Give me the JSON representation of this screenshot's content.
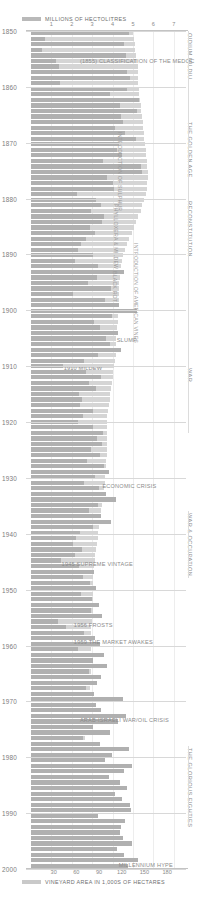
{
  "legend": {
    "top": {
      "swatch": "production-swatch",
      "label": "MILLIONS OF HECTOLITRES"
    },
    "bottom": {
      "swatch": "area-swatch",
      "label": "VINEYARD AREA IN 1,000S OF HECTARES"
    }
  },
  "colors": {
    "production_bar": "#b0b0b0",
    "area_bar": "#d5d5d5",
    "grid": "#ededed",
    "year_line": "#d8d8d8",
    "text": "#8b8b8b"
  },
  "chart_data": {
    "type": "bar",
    "title": "MILLIONS OF HECTOLITRES",
    "xlabel": "MILLIONS OF HECTOLITRES",
    "xlabel_secondary": "VINEYARD AREA IN 1,000S OF HECTARES",
    "ylabel": "",
    "orientation": "horizontal",
    "grid": true,
    "legend_position": "top-left",
    "axis_top": {
      "label": "MILLIONS OF HECTOLITRES",
      "ticks": [
        1,
        2,
        3,
        4,
        5,
        6,
        7
      ],
      "range": [
        0,
        7.6
      ]
    },
    "axis_bottom": {
      "label": "VINEYARD AREA IN 1,000S OF HECTARES",
      "ticks": [
        30,
        60,
        90,
        120,
        150,
        180
      ],
      "range": [
        0,
        205
      ]
    },
    "year_axis": {
      "ticks": [
        1850,
        1860,
        1870,
        1880,
        1890,
        1900,
        1910,
        1920,
        1930,
        1940,
        1950,
        1960,
        1970,
        1980,
        1990,
        2000
      ],
      "range": [
        1850,
        2000
      ]
    },
    "series": [
      {
        "name": "VINEYARD AREA IN 1,000S OF HECTARES",
        "color": "#d5d5d5"
      },
      {
        "name": "MILLIONS OF HECTOLITRES",
        "color": "#b0b0b0"
      }
    ],
    "rows": [
      {
        "year": 1850,
        "production": 4.8,
        "area": 135
      },
      {
        "year": 1851,
        "production": 0.7,
        "area": 136
      },
      {
        "year": 1852,
        "production": 4.55,
        "area": 137
      },
      {
        "year": 1853,
        "production": 0.55,
        "area": 138
      },
      {
        "year": 1854,
        "production": 4.65,
        "area": 139
      },
      {
        "year": 1855,
        "production": 1.25,
        "area": 140
      },
      {
        "year": 1856,
        "production": 1.35,
        "area": 141
      },
      {
        "year": 1857,
        "production": 4.7,
        "area": 141
      },
      {
        "year": 1858,
        "production": 4.85,
        "area": 142
      },
      {
        "year": 1859,
        "production": 1.4,
        "area": 142
      },
      {
        "year": 1860,
        "production": 4.7,
        "area": 143
      },
      {
        "year": 1861,
        "production": 3.85,
        "area": 143
      },
      {
        "year": 1862,
        "production": 5.3,
        "area": 144
      },
      {
        "year": 1863,
        "production": 4.35,
        "area": 145
      },
      {
        "year": 1864,
        "production": 5.2,
        "area": 146
      },
      {
        "year": 1865,
        "production": 4.4,
        "area": 147
      },
      {
        "year": 1866,
        "production": 4.5,
        "area": 148
      },
      {
        "year": 1867,
        "production": 4.1,
        "area": 148
      },
      {
        "year": 1868,
        "production": 4.6,
        "area": 149
      },
      {
        "year": 1869,
        "production": 5.15,
        "area": 150
      },
      {
        "year": 1870,
        "production": 4.3,
        "area": 151
      },
      {
        "year": 1871,
        "production": 4.2,
        "area": 152
      },
      {
        "year": 1872,
        "production": 4.45,
        "area": 152
      },
      {
        "year": 1873,
        "production": 3.55,
        "area": 153
      },
      {
        "year": 1874,
        "production": 5.4,
        "area": 154
      },
      {
        "year": 1875,
        "production": 5.45,
        "area": 155
      },
      {
        "year": 1876,
        "production": 3.75,
        "area": 155
      },
      {
        "year": 1877,
        "production": 4.0,
        "area": 154
      },
      {
        "year": 1878,
        "production": 4.05,
        "area": 153
      },
      {
        "year": 1879,
        "production": 2.25,
        "area": 152
      },
      {
        "year": 1880,
        "production": 3.2,
        "area": 150
      },
      {
        "year": 1881,
        "production": 3.45,
        "area": 147
      },
      {
        "year": 1882,
        "production": 2.95,
        "area": 145
      },
      {
        "year": 1883,
        "production": 3.6,
        "area": 142
      },
      {
        "year": 1884,
        "production": 3.5,
        "area": 139
      },
      {
        "year": 1885,
        "production": 2.9,
        "area": 136
      },
      {
        "year": 1886,
        "production": 3.15,
        "area": 133
      },
      {
        "year": 1887,
        "production": 2.7,
        "area": 130
      },
      {
        "year": 1888,
        "production": 2.45,
        "area": 127
      },
      {
        "year": 1889,
        "production": 2.3,
        "area": 124
      },
      {
        "year": 1890,
        "production": 3.05,
        "area": 122
      },
      {
        "year": 1891,
        "production": 2.15,
        "area": 120
      },
      {
        "year": 1892,
        "production": 3.3,
        "area": 119
      },
      {
        "year": 1893,
        "production": 4.55,
        "area": 118
      },
      {
        "year": 1894,
        "production": 3.25,
        "area": 118
      },
      {
        "year": 1895,
        "production": 2.8,
        "area": 117
      },
      {
        "year": 1896,
        "production": 3.9,
        "area": 117
      },
      {
        "year": 1897,
        "production": 2.05,
        "area": 116
      },
      {
        "year": 1898,
        "production": 3.65,
        "area": 116
      },
      {
        "year": 1899,
        "production": 4.3,
        "area": 116
      },
      {
        "year": 1900,
        "production": 5.2,
        "area": 116
      },
      {
        "year": 1901,
        "production": 3.95,
        "area": 115
      },
      {
        "year": 1902,
        "production": 3.1,
        "area": 115
      },
      {
        "year": 1903,
        "production": 3.4,
        "area": 114
      },
      {
        "year": 1904,
        "production": 4.25,
        "area": 114
      },
      {
        "year": 1905,
        "production": 3.7,
        "area": 113
      },
      {
        "year": 1906,
        "production": 3.85,
        "area": 113
      },
      {
        "year": 1907,
        "production": 4.4,
        "area": 112
      },
      {
        "year": 1908,
        "production": 3.3,
        "area": 112
      },
      {
        "year": 1909,
        "production": 2.6,
        "area": 111
      },
      {
        "year": 1910,
        "production": 1.55,
        "area": 110
      },
      {
        "year": 1911,
        "production": 2.7,
        "area": 109
      },
      {
        "year": 1912,
        "production": 3.45,
        "area": 108
      },
      {
        "year": 1913,
        "production": 2.85,
        "area": 107
      },
      {
        "year": 1914,
        "production": 3.2,
        "area": 106
      },
      {
        "year": 1915,
        "production": 2.35,
        "area": 105
      },
      {
        "year": 1916,
        "production": 2.5,
        "area": 104
      },
      {
        "year": 1917,
        "production": 2.4,
        "area": 103
      },
      {
        "year": 1918,
        "production": 3.05,
        "area": 102
      },
      {
        "year": 1919,
        "production": 2.55,
        "area": 101
      },
      {
        "year": 1920,
        "production": 2.3,
        "area": 100
      },
      {
        "year": 1921,
        "production": 3.05,
        "area": 100
      },
      {
        "year": 1922,
        "production": 3.55,
        "area": 100
      },
      {
        "year": 1923,
        "production": 3.25,
        "area": 100
      },
      {
        "year": 1924,
        "production": 3.5,
        "area": 100
      },
      {
        "year": 1925,
        "production": 2.95,
        "area": 100
      },
      {
        "year": 1926,
        "production": 3.4,
        "area": 100
      },
      {
        "year": 1927,
        "production": 2.75,
        "area": 99
      },
      {
        "year": 1928,
        "production": 3.6,
        "area": 99
      },
      {
        "year": 1929,
        "production": 3.8,
        "area": 99
      },
      {
        "year": 1930,
        "production": 3.15,
        "area": 98
      },
      {
        "year": 1931,
        "production": 2.6,
        "area": 98
      },
      {
        "year": 1932,
        "production": 3.35,
        "area": 97
      },
      {
        "year": 1933,
        "production": 3.7,
        "area": 96
      },
      {
        "year": 1934,
        "production": 4.15,
        "area": 95
      },
      {
        "year": 1935,
        "production": 3.3,
        "area": 94
      },
      {
        "year": 1936,
        "production": 2.85,
        "area": 93
      },
      {
        "year": 1937,
        "production": 3.45,
        "area": 92
      },
      {
        "year": 1938,
        "production": 3.9,
        "area": 91
      },
      {
        "year": 1939,
        "production": 3.05,
        "area": 90
      },
      {
        "year": 1940,
        "production": 2.4,
        "area": 89
      },
      {
        "year": 1941,
        "production": 2.2,
        "area": 88
      },
      {
        "year": 1942,
        "production": 2.05,
        "area": 87
      },
      {
        "year": 1943,
        "production": 2.5,
        "area": 86
      },
      {
        "year": 1944,
        "production": 2.15,
        "area": 85
      },
      {
        "year": 1945,
        "production": 1.45,
        "area": 84
      },
      {
        "year": 1946,
        "production": 2.35,
        "area": 83
      },
      {
        "year": 1947,
        "production": 3.1,
        "area": 83
      },
      {
        "year": 1948,
        "production": 2.55,
        "area": 82
      },
      {
        "year": 1949,
        "production": 2.9,
        "area": 82
      },
      {
        "year": 1950,
        "production": 3.2,
        "area": 82
      },
      {
        "year": 1951,
        "production": 2.45,
        "area": 82
      },
      {
        "year": 1952,
        "production": 3.0,
        "area": 82
      },
      {
        "year": 1953,
        "production": 3.35,
        "area": 82
      },
      {
        "year": 1954,
        "production": 2.95,
        "area": 82
      },
      {
        "year": 1955,
        "production": 3.5,
        "area": 82
      },
      {
        "year": 1956,
        "production": 1.3,
        "area": 81
      },
      {
        "year": 1957,
        "production": 1.7,
        "area": 80
      },
      {
        "year": 1958,
        "production": 2.6,
        "area": 80
      },
      {
        "year": 1959,
        "production": 3.15,
        "area": 80
      },
      {
        "year": 1960,
        "production": 3.4,
        "area": 80
      },
      {
        "year": 1961,
        "production": 2.3,
        "area": 80
      },
      {
        "year": 1962,
        "production": 3.6,
        "area": 80
      },
      {
        "year": 1963,
        "production": 3.05,
        "area": 80
      },
      {
        "year": 1964,
        "production": 3.75,
        "area": 80
      },
      {
        "year": 1965,
        "production": 2.85,
        "area": 79
      },
      {
        "year": 1966,
        "production": 3.45,
        "area": 79
      },
      {
        "year": 1967,
        "production": 3.25,
        "area": 78
      },
      {
        "year": 1968,
        "production": 2.7,
        "area": 78
      },
      {
        "year": 1969,
        "production": 3.1,
        "area": 77
      },
      {
        "year": 1970,
        "production": 4.5,
        "area": 77
      },
      {
        "year": 1971,
        "production": 3.2,
        "area": 76
      },
      {
        "year": 1972,
        "production": 3.45,
        "area": 75
      },
      {
        "year": 1973,
        "production": 4.65,
        "area": 74
      },
      {
        "year": 1974,
        "production": 4.25,
        "area": 73
      },
      {
        "year": 1975,
        "production": 3.05,
        "area": 72
      },
      {
        "year": 1976,
        "production": 3.85,
        "area": 72
      },
      {
        "year": 1977,
        "production": 2.55,
        "area": 71
      },
      {
        "year": 1978,
        "production": 3.4,
        "area": 71
      },
      {
        "year": 1979,
        "production": 4.8,
        "area": 71
      },
      {
        "year": 1980,
        "production": 3.95,
        "area": 71
      },
      {
        "year": 1981,
        "production": 3.65,
        "area": 71
      },
      {
        "year": 1982,
        "production": 4.95,
        "area": 72
      },
      {
        "year": 1983,
        "production": 4.55,
        "area": 72
      },
      {
        "year": 1984,
        "production": 3.8,
        "area": 73
      },
      {
        "year": 1985,
        "production": 4.35,
        "area": 73
      },
      {
        "year": 1986,
        "production": 4.7,
        "area": 74
      },
      {
        "year": 1987,
        "production": 4.1,
        "area": 75
      },
      {
        "year": 1988,
        "production": 4.45,
        "area": 76
      },
      {
        "year": 1989,
        "production": 4.85,
        "area": 77
      },
      {
        "year": 1990,
        "production": 4.9,
        "area": 78
      },
      {
        "year": 1991,
        "production": 3.3,
        "area": 79
      },
      {
        "year": 1992,
        "production": 4.6,
        "area": 80
      },
      {
        "year": 1993,
        "production": 4.4,
        "area": 81
      },
      {
        "year": 1994,
        "production": 4.35,
        "area": 82
      },
      {
        "year": 1995,
        "production": 4.5,
        "area": 83
      },
      {
        "year": 1996,
        "production": 4.95,
        "area": 84
      },
      {
        "year": 1997,
        "production": 4.2,
        "area": 85
      },
      {
        "year": 1998,
        "production": 4.55,
        "area": 86
      },
      {
        "year": 1999,
        "production": 5.25,
        "area": 87
      },
      {
        "year": 2000,
        "production": 4.75,
        "area": 88
      }
    ],
    "annotations": [
      {
        "text": "(1855) CLASSIFICATION OF THE MEDOC",
        "year": 1855,
        "orientation": "horizontal",
        "x_value": 2.4
      },
      {
        "text": "INTRODUCTION OF SULPHUR",
        "year": 1868,
        "orientation": "vertical",
        "x_value": 4.5
      },
      {
        "text": "PHYLLOXERA & MILDEW",
        "year": 1881,
        "orientation": "vertical",
        "x_value": 4.3
      },
      {
        "text": "BLACK ROT",
        "year": 1893,
        "orientation": "vertical",
        "x_value": 4.25
      },
      {
        "text": "INTRODUCTION OF AMERICAN VINES",
        "year": 1888,
        "orientation": "vertical",
        "x_value": 5.3
      },
      {
        "text": "SLUMP",
        "year": 1905,
        "orientation": "horizontal",
        "x_value": 4.2
      },
      {
        "text": "1910 MILDEW",
        "year": 1910,
        "orientation": "horizontal",
        "x_value": 1.6
      },
      {
        "text": "ECONOMIC CRISIS",
        "year": 1931,
        "orientation": "horizontal",
        "x_value": 3.5
      },
      {
        "text": "1945 SUPREME VINTAGE",
        "year": 1945,
        "orientation": "horizontal",
        "x_value": 1.5
      },
      {
        "text": "1956 FROSTS",
        "year": 1956,
        "orientation": "horizontal",
        "x_value": 2.1
      },
      {
        "text": "1959 THE MARKET AWAKES",
        "year": 1959,
        "orientation": "horizontal",
        "x_value": 2.1
      },
      {
        "text": "ARAB-ISRAELI WAR/OIL CRISIS",
        "year": 1973,
        "orientation": "horizontal",
        "x_value": 2.4
      },
      {
        "text": "MILLENNIUM HYPE",
        "year": 1999,
        "orientation": "horizontal",
        "x_value": 4.3
      }
    ],
    "eras": [
      {
        "label": "OIDIUM MILDIU",
        "start": 1850,
        "end": 1866
      },
      {
        "label": "THE GOLDEN AGE",
        "start": 1866,
        "end": 1880
      },
      {
        "label": "RECONSTITUTION",
        "start": 1880,
        "end": 1910
      },
      {
        "label": "WAR",
        "start": 1910,
        "end": 1922
      },
      {
        "label": "WAR & OCCUPATION",
        "start": 1936,
        "end": 1948
      },
      {
        "label": "THE GLORIOUS EIGHTIES",
        "start": 1978,
        "end": 1992
      }
    ]
  }
}
